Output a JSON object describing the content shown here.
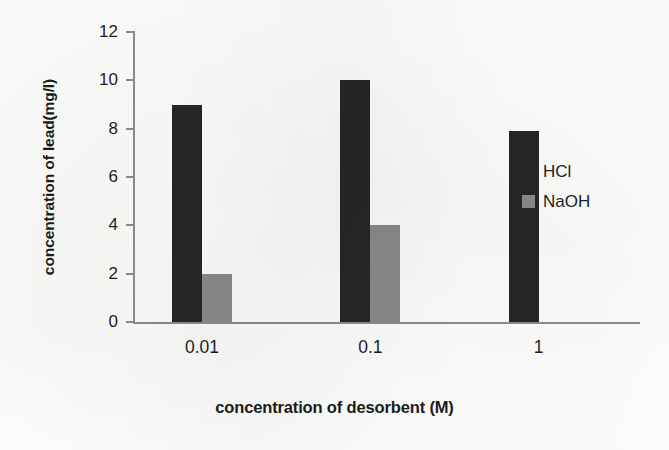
{
  "chart_data": {
    "type": "bar",
    "title": "",
    "xlabel": "concentration of desorbent (M)",
    "ylabel": "concentration of lead(mg/l)",
    "categories": [
      "0.01",
      "0.1",
      "1"
    ],
    "series": [
      {
        "name": "HCl",
        "color": "#262626",
        "values": [
          9,
          10,
          7.9
        ]
      },
      {
        "name": "NaOH",
        "color": "#8a8a8a",
        "values": [
          2,
          4,
          0
        ]
      }
    ],
    "ylim": [
      0,
      12
    ],
    "ytick_values": [
      12,
      10,
      8,
      6,
      4,
      2,
      0
    ],
    "ytick_labels": [
      "12",
      "10",
      "8",
      "6",
      "4",
      "2",
      "0"
    ],
    "grid": false,
    "legend_position": "right-center",
    "legend_entries": [
      "HCl",
      "NaOH"
    ],
    "axis_color": "#8d8d8d",
    "background": "#fdfdfc"
  }
}
